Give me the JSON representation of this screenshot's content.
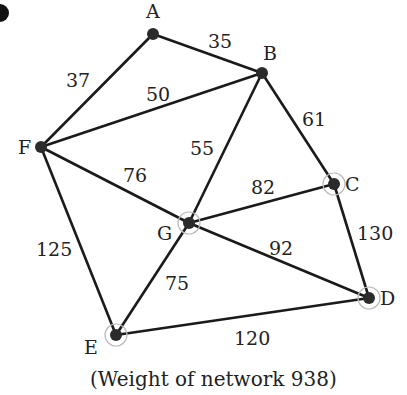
{
  "caption": "(Weight of network 938)",
  "nodes": [
    {
      "id": "A",
      "x": 153,
      "y": 34,
      "lx": 146,
      "ly": 18
    },
    {
      "id": "B",
      "x": 262,
      "y": 73,
      "lx": 263,
      "ly": 60
    },
    {
      "id": "C",
      "x": 334,
      "y": 184,
      "lx": 345,
      "ly": 191
    },
    {
      "id": "D",
      "x": 369,
      "y": 298,
      "lx": 380,
      "ly": 305
    },
    {
      "id": "E",
      "x": 116,
      "y": 335,
      "lx": 84,
      "ly": 354
    },
    {
      "id": "F",
      "x": 41,
      "y": 147,
      "lx": 18,
      "ly": 154
    },
    {
      "id": "G",
      "x": 189,
      "y": 223,
      "lx": 157,
      "ly": 240
    }
  ],
  "edges": [
    {
      "from": "A",
      "to": "B",
      "w": "35",
      "lx": 208,
      "ly": 48
    },
    {
      "from": "A",
      "to": "F",
      "w": "37",
      "lx": 66,
      "ly": 87
    },
    {
      "from": "F",
      "to": "B",
      "w": "50",
      "lx": 146,
      "ly": 101
    },
    {
      "from": "B",
      "to": "G",
      "w": "55",
      "lx": 190,
      "ly": 155
    },
    {
      "from": "B",
      "to": "C",
      "w": "61",
      "lx": 302,
      "ly": 126
    },
    {
      "from": "F",
      "to": "G",
      "w": "76",
      "lx": 123,
      "ly": 182
    },
    {
      "from": "G",
      "to": "C",
      "w": "82",
      "lx": 251,
      "ly": 194
    },
    {
      "from": "C",
      "to": "D",
      "w": "130",
      "lx": 357,
      "ly": 240
    },
    {
      "from": "F",
      "to": "E",
      "w": "125",
      "lx": 36,
      "ly": 256
    },
    {
      "from": "G",
      "to": "D",
      "w": "92",
      "lx": 269,
      "ly": 255
    },
    {
      "from": "G",
      "to": "E",
      "w": "75",
      "lx": 165,
      "ly": 290
    },
    {
      "from": "E",
      "to": "D",
      "w": "120",
      "lx": 234,
      "ly": 345
    }
  ],
  "colors": {
    "line": "#1a1a1a",
    "node": "#2b2b2b",
    "text": "#222222"
  }
}
